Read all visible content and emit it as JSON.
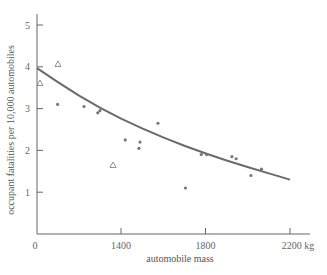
{
  "chart_data": {
    "type": "scatter",
    "title": "",
    "xlabel": "automobile mass",
    "ylabel": "occupant fatalities per 10,000 automobiles",
    "x_ticks": [
      {
        "label": "0",
        "value": 0
      },
      {
        "label": "1400",
        "value": 1400
      },
      {
        "label": "1800",
        "value": 1800
      },
      {
        "label": "2200 kg",
        "value": 2200
      }
    ],
    "y_ticks": [
      {
        "label": "1",
        "value": 1
      },
      {
        "label": "2",
        "value": 2
      },
      {
        "label": "3",
        "value": 3
      },
      {
        "label": "4",
        "value": 4
      },
      {
        "label": "5",
        "value": 5
      }
    ],
    "ylim": [
      0,
      5.2
    ],
    "xlim_note": "axis broken between 0 and ~1000 kg",
    "grid": false,
    "legend": null,
    "series": [
      {
        "name": "triangles",
        "marker": "triangle",
        "points": [
          {
            "x": 1000,
            "y": 3.6
          },
          {
            "x": 1090,
            "y": 4.1
          },
          {
            "x": 1360,
            "y": 1.65
          }
        ]
      },
      {
        "name": "dots",
        "marker": "dot",
        "points": [
          {
            "x": 1100,
            "y": 3.1
          },
          {
            "x": 1225,
            "y": 3.05
          },
          {
            "x": 1290,
            "y": 2.9
          },
          {
            "x": 1300,
            "y": 2.95
          },
          {
            "x": 1420,
            "y": 2.25
          },
          {
            "x": 1490,
            "y": 2.2
          },
          {
            "x": 1485,
            "y": 2.05
          },
          {
            "x": 1575,
            "y": 2.65
          },
          {
            "x": 1705,
            "y": 1.1
          },
          {
            "x": 1780,
            "y": 1.9
          },
          {
            "x": 1805,
            "y": 1.9
          },
          {
            "x": 1925,
            "y": 1.85
          },
          {
            "x": 1945,
            "y": 1.8
          },
          {
            "x": 2015,
            "y": 1.4
          },
          {
            "x": 2065,
            "y": 1.55
          }
        ]
      }
    ],
    "fit_curve": {
      "name": "trend curve",
      "points": [
        {
          "x": 980,
          "y": 3.97
        },
        {
          "x": 1200,
          "y": 3.3
        },
        {
          "x": 1400,
          "y": 2.75
        },
        {
          "x": 1600,
          "y": 2.3
        },
        {
          "x": 1800,
          "y": 1.92
        },
        {
          "x": 2000,
          "y": 1.6
        },
        {
          "x": 2200,
          "y": 1.3
        }
      ]
    }
  },
  "colors": {
    "axis": "#666666",
    "curve": "#6a6a6a",
    "markers": "#777777",
    "text": "#555555"
  }
}
